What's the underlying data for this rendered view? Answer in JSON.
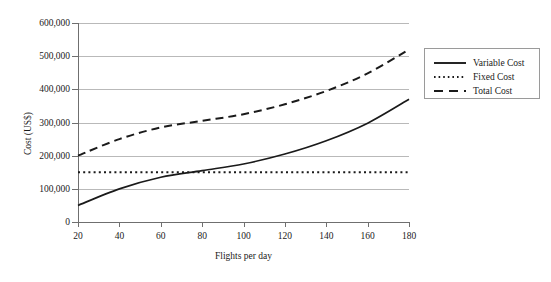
{
  "chart_data": {
    "type": "line",
    "title": "",
    "xlabel": "Flights per day",
    "ylabel": "Cost (US$)",
    "xlim": [
      20,
      180
    ],
    "ylim": [
      0,
      600000
    ],
    "grid": "horizontal",
    "legend_position": "right",
    "x_ticks": [
      "20",
      "40",
      "60",
      "80",
      "100",
      "120",
      "140",
      "160",
      "180"
    ],
    "y_ticks": [
      "0",
      "100,000",
      "200,000",
      "300,000",
      "400,000",
      "500,000",
      "600,000"
    ],
    "x": [
      20,
      40,
      60,
      80,
      100,
      120,
      140,
      160,
      180
    ],
    "series": [
      {
        "name": "Variable Cost",
        "style": "solid",
        "color": "#1a1a1a",
        "values": [
          50000,
          100000,
          135000,
          155000,
          175000,
          205000,
          245000,
          298000,
          370000
        ]
      },
      {
        "name": "Fixed Cost",
        "style": "dotted",
        "color": "#1a1a1a",
        "values": [
          150000,
          150000,
          150000,
          150000,
          150000,
          150000,
          150000,
          150000,
          150000
        ]
      },
      {
        "name": "Total Cost",
        "style": "dashed",
        "color": "#1a1a1a",
        "values": [
          200000,
          250000,
          285000,
          305000,
          325000,
          355000,
          395000,
          448000,
          520000
        ]
      }
    ]
  },
  "legend": {
    "items": [
      {
        "label": "Variable Cost",
        "swatch": "solid-line-icon"
      },
      {
        "label": "Fixed Cost",
        "swatch": "dotted-line-icon"
      },
      {
        "label": "Total Cost",
        "swatch": "dashed-line-icon"
      }
    ]
  },
  "colors": {
    "series": "#1a1a1a",
    "gridline": "#b9b9b9",
    "axis": "#6f6f6f",
    "legend_border": "#9a9a9a",
    "background": "#ffffff"
  }
}
